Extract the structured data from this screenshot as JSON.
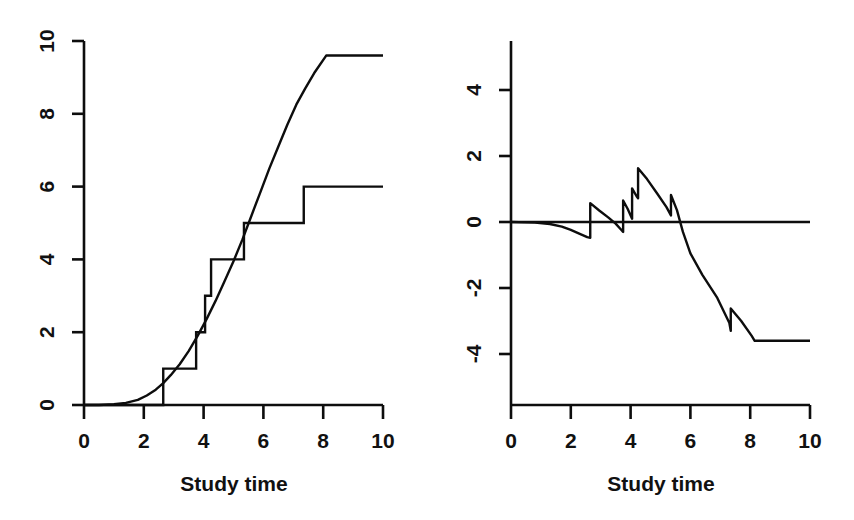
{
  "figure": {
    "background": "#ffffff",
    "ink_color": "#0d0d0d",
    "panel_count": 2
  },
  "chart_data": [
    {
      "panel": "left",
      "type": "line",
      "title": "",
      "xlabel": "Study time",
      "ylabel": "",
      "xlim": [
        0,
        10
      ],
      "ylim": [
        0,
        10
      ],
      "xticks": [
        0,
        2,
        4,
        6,
        8,
        10
      ],
      "yticks": [
        0,
        2,
        4,
        6,
        8,
        10
      ],
      "xticklabels": [
        "0",
        "2",
        "4",
        "6",
        "8",
        "10"
      ],
      "yticklabels": [
        "0",
        "2",
        "4",
        "6",
        "8",
        "10"
      ],
      "grid": false,
      "legend": "none",
      "series": [
        {
          "name": "Cumulative hazard (smooth fit)",
          "style": "smooth-line",
          "x": [
            0.0,
            0.5,
            1.0,
            1.4,
            1.8,
            2.1,
            2.4,
            2.65,
            2.9,
            3.2,
            3.5,
            3.8,
            4.1,
            4.4,
            4.7,
            5.0,
            5.3,
            5.6,
            5.9,
            6.2,
            6.5,
            6.8,
            7.1,
            7.4,
            7.7,
            8.1,
            8.6,
            9.2,
            10.0
          ],
          "y": [
            0.0,
            0.0,
            0.02,
            0.06,
            0.14,
            0.26,
            0.42,
            0.6,
            0.82,
            1.12,
            1.48,
            1.9,
            2.36,
            2.86,
            3.4,
            3.95,
            4.55,
            5.2,
            5.85,
            6.5,
            7.1,
            7.7,
            8.25,
            8.7,
            9.12,
            9.6,
            9.6,
            9.6,
            9.6
          ]
        },
        {
          "name": "Nelson-Aalen step estimate",
          "style": "step-post",
          "x": [
            0.0,
            2.65,
            3.75,
            4.05,
            4.25,
            5.35,
            7.35,
            10.0
          ],
          "y": [
            0.0,
            1.0,
            2.0,
            3.0,
            4.0,
            5.0,
            6.0,
            6.0
          ],
          "jump_times": [
            2.65,
            3.75,
            4.05,
            4.25,
            5.35,
            7.35
          ],
          "jump_values": [
            1,
            2,
            3,
            4,
            5,
            6
          ]
        }
      ]
    },
    {
      "panel": "right",
      "type": "line",
      "title": "",
      "xlabel": "Study time",
      "ylabel": "",
      "xlim": [
        0,
        10
      ],
      "ylim": [
        -5.0,
        5.2
      ],
      "xticks": [
        0,
        2,
        4,
        6,
        8,
        10
      ],
      "yticks": [
        -4,
        -2,
        0,
        2,
        4
      ],
      "xticklabels": [
        "0",
        "2",
        "4",
        "6",
        "8",
        "10"
      ],
      "yticklabels": [
        "-4",
        "-2",
        "0",
        "2",
        "4"
      ],
      "grid": false,
      "legend": "none",
      "reference_line": {
        "name": "zero-line",
        "y": 0
      },
      "series": [
        {
          "name": "Martingale residual process",
          "style": "sawtooth-line",
          "x": [
            0.0,
            0.8,
            1.3,
            1.7,
            2.0,
            2.3,
            2.55,
            2.65,
            2.65,
            2.95,
            3.25,
            3.5,
            3.7,
            3.75,
            3.75,
            3.9,
            4.05,
            4.05,
            4.2,
            4.25,
            4.25,
            4.55,
            4.9,
            5.2,
            5.35,
            5.35,
            5.55,
            5.75,
            6.0,
            6.4,
            6.9,
            7.3,
            7.35,
            7.35,
            7.7,
            8.05,
            8.15,
            9.0,
            10.0
          ],
          "y": [
            0.0,
            -0.02,
            -0.06,
            -0.14,
            -0.24,
            -0.36,
            -0.46,
            -0.48,
            0.57,
            0.35,
            0.14,
            -0.05,
            -0.25,
            -0.3,
            0.65,
            0.4,
            0.1,
            1.02,
            0.78,
            0.72,
            1.63,
            1.3,
            0.85,
            0.45,
            0.2,
            0.82,
            0.36,
            -0.3,
            -0.95,
            -1.6,
            -2.3,
            -3.05,
            -3.3,
            -2.62,
            -3.0,
            -3.45,
            -3.6,
            -3.6,
            -3.6
          ]
        }
      ]
    }
  ],
  "panels": {
    "left": {
      "name": "cumulative-hazard-panel",
      "xaxis_title": "Study time",
      "xticklabels": [
        "0",
        "2",
        "4",
        "6",
        "8",
        "10"
      ],
      "yticklabels": [
        "0",
        "2",
        "4",
        "6",
        "8",
        "10"
      ]
    },
    "right": {
      "name": "martingale-residual-panel",
      "xaxis_title": "Study time",
      "xticklabels": [
        "0",
        "2",
        "4",
        "6",
        "8",
        "10"
      ],
      "yticklabels": [
        "-4",
        "-2",
        "0",
        "2",
        "4"
      ]
    }
  }
}
